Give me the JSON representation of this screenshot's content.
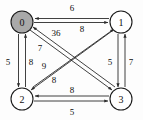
{
  "diagram": {
    "type": "directed-weighted-graph",
    "background_color": "#fdfdfd",
    "stroke_color": "#2b2b2b",
    "shaded_node_color": "#a9a9a9",
    "unshaded_node_color": "#ffffff",
    "nodes": [
      {
        "id": "0",
        "label": "0",
        "cx": 22,
        "cy": 22,
        "r": 11,
        "shaded": true
      },
      {
        "id": "1",
        "label": "1",
        "cx": 121,
        "cy": 22,
        "r": 11,
        "shaded": false
      },
      {
        "id": "2",
        "label": "2",
        "cx": 22,
        "cy": 99,
        "r": 11,
        "shaded": false
      },
      {
        "id": "3",
        "label": "3",
        "cx": 121,
        "cy": 99,
        "r": 11,
        "shaded": false
      }
    ],
    "edges": [
      {
        "from": "1",
        "to": "0",
        "weight": "6",
        "label_x": 72,
        "label_y": 8
      },
      {
        "from": "0",
        "to": "1",
        "weight": "8",
        "label_x": 82,
        "label_y": 29
      },
      {
        "from": "0",
        "to": "2",
        "weight": "5",
        "label_x": 8,
        "label_y": 62
      },
      {
        "from": "2",
        "to": "0",
        "weight": "8",
        "label_x": 25,
        "label_y": 62
      },
      {
        "from": "1",
        "to": "3",
        "weight": "5",
        "label_x": 110,
        "label_y": 62
      },
      {
        "from": "3",
        "to": "1",
        "weight": "7",
        "label_x": 130,
        "label_y": 62
      },
      {
        "from": "2",
        "to": "3",
        "weight": "8",
        "label_x": 72,
        "label_y": 90
      },
      {
        "from": "3",
        "to": "2",
        "weight": "5",
        "label_x": 72,
        "label_y": 112
      },
      {
        "from": "0",
        "to": "3",
        "weight": "3",
        "label_x": 50,
        "label_y": 33
      },
      {
        "from": "3",
        "to": "0",
        "weight": "6",
        "label_x": 61,
        "label_y": 33
      },
      {
        "from": "2",
        "to": "1",
        "weight": "7",
        "label_x": 40,
        "label_y": 48
      },
      {
        "from": "1",
        "to": "2",
        "weight": "9",
        "label_x": 44,
        "label_y": 66
      },
      {
        "from": "1",
        "to": "2",
        "weight": "8",
        "label_x": 54,
        "label_y": 80
      }
    ],
    "weight_labels": [
      {
        "text": "6",
        "x": 72,
        "y": 8
      },
      {
        "text": "8",
        "x": 82,
        "y": 29
      },
      {
        "text": "5",
        "x": 8,
        "y": 62
      },
      {
        "text": "8",
        "x": 25,
        "y": 62
      },
      {
        "text": "5",
        "x": 110,
        "y": 62
      },
      {
        "text": "7",
        "x": 130,
        "y": 62
      },
      {
        "text": "8",
        "x": 72,
        "y": 90
      },
      {
        "text": "5",
        "x": 72,
        "y": 112
      },
      {
        "text": "36",
        "x": 56,
        "y": 33
      },
      {
        "text": "7",
        "x": 40,
        "y": 48
      },
      {
        "text": "9",
        "x": 44,
        "y": 66
      },
      {
        "text": "8",
        "x": 54,
        "y": 80
      }
    ]
  }
}
